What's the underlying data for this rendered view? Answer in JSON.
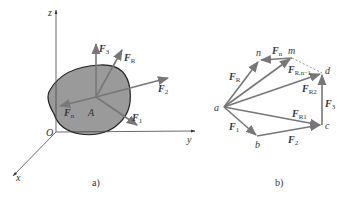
{
  "figure_a": {
    "caption": "a)",
    "axes": {
      "x": "x",
      "y": "y",
      "z": "z",
      "origin": "O"
    },
    "point": "A",
    "forces": [
      {
        "name": "F",
        "sub": "3"
      },
      {
        "name": "F",
        "sub": "R"
      },
      {
        "name": "F",
        "sub": "2"
      },
      {
        "name": "F",
        "sub": "1"
      },
      {
        "name": "F",
        "sub": "n"
      }
    ],
    "body_color": "#9a9a9a"
  },
  "figure_b": {
    "caption": "b)",
    "points": {
      "a": "a",
      "b": "b",
      "c": "c",
      "d": "d",
      "m": "m",
      "n": "n"
    },
    "forces": {
      "FR": {
        "name": "F",
        "sub": "R"
      },
      "Fn": {
        "name": "F",
        "sub": "n"
      },
      "FRn": {
        "name": "F",
        "sub": "R,n−1"
      },
      "FR2": {
        "name": "F",
        "sub": "R2"
      },
      "FR1": {
        "name": "F",
        "sub": "R1"
      },
      "F1": {
        "name": "F",
        "sub": "1"
      },
      "F2": {
        "name": "F",
        "sub": "2"
      },
      "F3": {
        "name": "F",
        "sub": "3"
      }
    }
  }
}
